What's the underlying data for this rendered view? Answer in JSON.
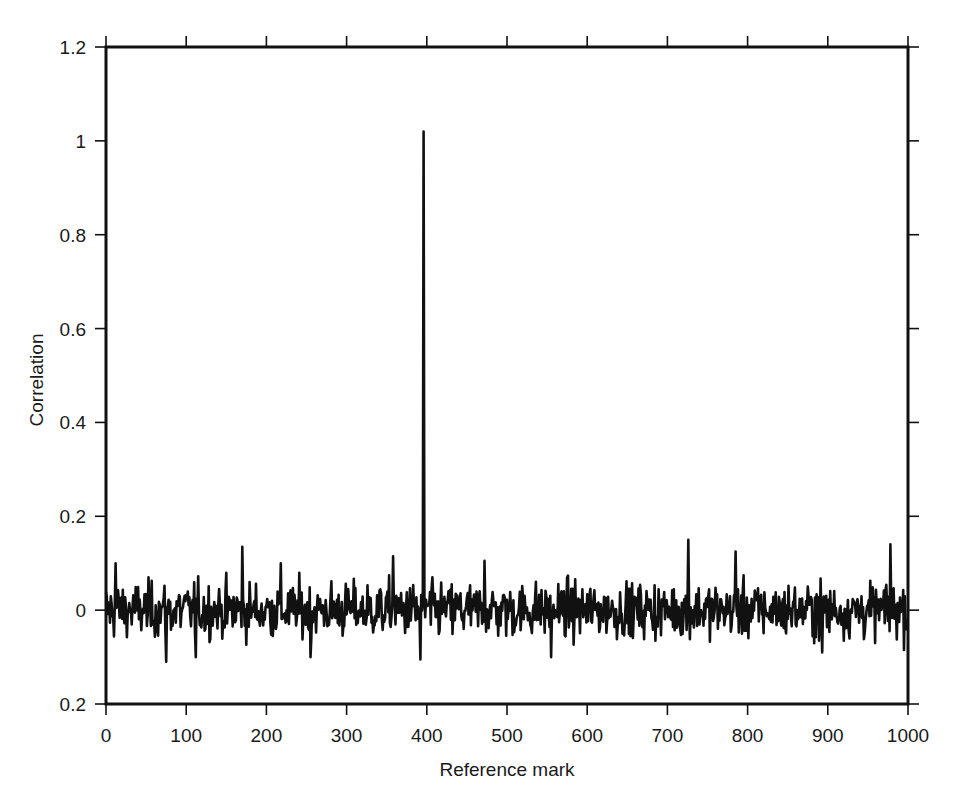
{
  "chart_data": {
    "type": "line",
    "title": "",
    "xlabel": "Reference mark",
    "ylabel": "Correlation",
    "xlim": [
      0,
      1000
    ],
    "ylim": [
      -0.2,
      1.2
    ],
    "grid": false,
    "legend": null,
    "x_ticks": [
      0,
      100,
      200,
      300,
      400,
      500,
      600,
      700,
      800,
      900,
      1000
    ],
    "x_tick_labels": [
      "0",
      "100",
      "200",
      "300",
      "400",
      "500",
      "600",
      "700",
      "800",
      "900",
      "1000"
    ],
    "y_ticks": [
      1.2,
      1.0,
      0.8,
      0.6,
      0.4,
      0.2,
      0.0,
      -0.2
    ],
    "y_tick_labels": [
      "1.2",
      "1",
      "0.8",
      "0.6",
      "0.4",
      "0.2",
      "0",
      "0.2"
    ],
    "series": [
      {
        "name": "correlation",
        "color": "#111111",
        "description": "Noise floor around 0 (approx. ±0.05, occasional ±0.1–0.15) with a single sharp peak",
        "n_points": 1000,
        "noise_std": 0.04,
        "peak": {
          "x": 396,
          "y": 1.02
        },
        "notable_points": [
          {
            "x": 12,
            "y": 0.1
          },
          {
            "x": 75,
            "y": -0.11
          },
          {
            "x": 112,
            "y": -0.1
          },
          {
            "x": 170,
            "y": 0.135
          },
          {
            "x": 218,
            "y": 0.1
          },
          {
            "x": 255,
            "y": -0.1
          },
          {
            "x": 358,
            "y": 0.115
          },
          {
            "x": 392,
            "y": -0.105
          },
          {
            "x": 396,
            "y": 1.02
          },
          {
            "x": 472,
            "y": 0.105
          },
          {
            "x": 555,
            "y": -0.1
          },
          {
            "x": 726,
            "y": 0.15
          },
          {
            "x": 785,
            "y": 0.125
          },
          {
            "x": 893,
            "y": -0.09
          },
          {
            "x": 978,
            "y": 0.14
          }
        ]
      }
    ]
  },
  "layout": {
    "plot_box": {
      "left": 106,
      "right": 908,
      "top": 47,
      "bottom": 704
    }
  }
}
